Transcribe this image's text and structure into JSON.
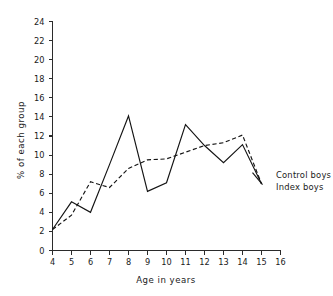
{
  "chart_data": {
    "type": "line",
    "title": "",
    "xlabel": "Age  in  years",
    "ylabel": "% of each group",
    "xlim": [
      4,
      16
    ],
    "ylim": [
      0,
      24
    ],
    "grid": false,
    "legend_position": "right-inline",
    "x": [
      4,
      5,
      6,
      7,
      8,
      9,
      10,
      11,
      12,
      13,
      14,
      15
    ],
    "xticks": [
      "4",
      "5",
      "6",
      "7",
      "8",
      "9",
      "10",
      "11",
      "12",
      "13",
      "14",
      "15",
      "16"
    ],
    "xtick_values": [
      4,
      5,
      6,
      7,
      8,
      9,
      10,
      11,
      12,
      13,
      14,
      15,
      16
    ],
    "yticks": [
      "0",
      "2",
      "4",
      "6",
      "8",
      "10",
      "12",
      "14",
      "16",
      "18",
      "20",
      "22",
      "24"
    ],
    "ytick_values": [
      0,
      2,
      4,
      6,
      8,
      10,
      12,
      14,
      16,
      18,
      20,
      22,
      24
    ],
    "series": [
      {
        "name": "Control boys",
        "style": "dashed",
        "values": [
          2.2,
          3.7,
          7.2,
          6.6,
          8.6,
          9.5,
          9.6,
          10.3,
          11.0,
          11.3,
          12.1,
          7.0
        ]
      },
      {
        "name": "Index boys",
        "style": "solid",
        "values": [
          2.2,
          5.1,
          4.0,
          9.0,
          14.1,
          6.2,
          7.1,
          13.2,
          11.0,
          9.2,
          11.1,
          7.0
        ]
      }
    ]
  },
  "legend": {
    "entries": [
      {
        "label": "Control boys",
        "style": "dashed"
      },
      {
        "label": "Index boys",
        "style": "solid"
      }
    ]
  },
  "axes": {
    "x_title": "Age  in  years",
    "y_title": "% of each group"
  }
}
